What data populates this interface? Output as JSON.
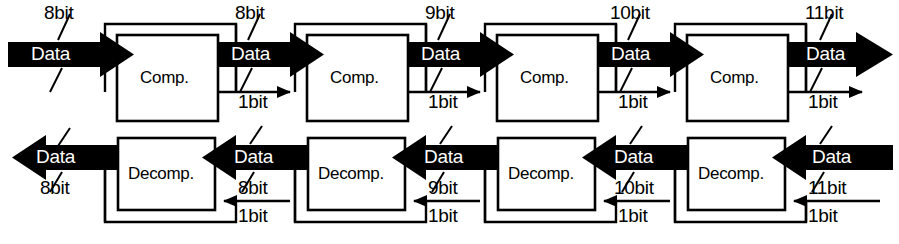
{
  "diagram": {
    "type": "block-diagram",
    "colors": {
      "ink": "#000000",
      "paper": "#ffffff",
      "arrow_text": "#ffffff"
    },
    "stages": [
      {
        "index": 1,
        "compressor_label": "Comp.",
        "decompressor_label": "Decomp.",
        "feedback_label": "1bit",
        "decomp_feedback_label": "1bit"
      },
      {
        "index": 2,
        "compressor_label": "Comp.",
        "decompressor_label": "Decomp.",
        "feedback_label": "1bit",
        "decomp_feedback_label": "1bit"
      },
      {
        "index": 3,
        "compressor_label": "Comp.",
        "decompressor_label": "Decomp.",
        "feedback_label": "1bit",
        "decomp_feedback_label": "1bit"
      },
      {
        "index": 4,
        "compressor_label": "Comp.",
        "decompressor_label": "Decomp.",
        "feedback_label": "1bit",
        "decomp_feedback_label": "1bit"
      }
    ],
    "top_flow": {
      "direction": "left-to-right",
      "arrows": [
        {
          "data_label": "Data",
          "width_label": "8bit"
        },
        {
          "data_label": "Data",
          "width_label": "8bit"
        },
        {
          "data_label": "Data",
          "width_label": "9bit"
        },
        {
          "data_label": "Data",
          "width_label": "10bit"
        },
        {
          "data_label": "Data",
          "width_label": "11bit"
        }
      ]
    },
    "bottom_flow": {
      "direction": "right-to-left",
      "arrows": [
        {
          "data_label": "Data",
          "width_label": "8bit"
        },
        {
          "data_label": "Data",
          "width_label": "8bit"
        },
        {
          "data_label": "Data",
          "width_label": "9bit"
        },
        {
          "data_label": "Data",
          "width_label": "10bit"
        },
        {
          "data_label": "Data",
          "width_label": "11bit"
        }
      ]
    }
  }
}
